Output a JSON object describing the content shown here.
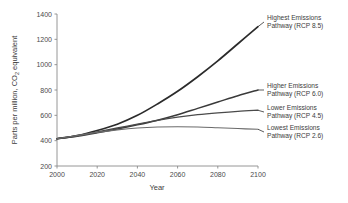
{
  "chart_data": {
    "type": "line",
    "title": "",
    "xlabel": "Year",
    "ylabel": "Parts per million, CO2 equivalent",
    "ylabel_main": "Parts per million, CO",
    "ylabel_sub": "2",
    "ylabel_tail": " equivalent",
    "xlim": [
      2000,
      2100
    ],
    "ylim": [
      200,
      1400
    ],
    "grid": false,
    "legend_position": "right-inline-annotations",
    "xticks": [
      2000,
      2020,
      2040,
      2060,
      2080,
      2100
    ],
    "xtick_labels": [
      "2000",
      "2020",
      "2040",
      "2060",
      "2080",
      "2100"
    ],
    "yticks": [
      200,
      400,
      600,
      800,
      1000,
      1200,
      1400
    ],
    "ytick_labels": [
      "200",
      "400",
      "600",
      "800",
      "1000",
      "1200",
      "1400"
    ],
    "x": [
      2000,
      2010,
      2020,
      2030,
      2040,
      2050,
      2060,
      2070,
      2080,
      2090,
      2100
    ],
    "series": [
      {
        "name": "Highest Emissions Pathway (RCP 8.5)",
        "label_line1": "Highest Emissions",
        "label_line2": "Pathway (RCP 8.5)",
        "color": "#2b2b2b",
        "width": 1.7,
        "values": [
          415,
          440,
          480,
          530,
          600,
          690,
          790,
          905,
          1030,
          1165,
          1300
        ]
      },
      {
        "name": "Higher Emissions Pathway (RCP 6.0)",
        "label_line1": "Higher Emissions",
        "label_line2": "Pathway (RCP 6.0)",
        "color": "#3a3a3a",
        "width": 1.5,
        "values": [
          415,
          435,
          462,
          492,
          525,
          562,
          605,
          655,
          705,
          755,
          800
        ]
      },
      {
        "name": "Lower Emissions Pathway (RCP 4.5)",
        "label_line1": "Lower Emissions",
        "label_line2": "Pathway (RCP 4.5)",
        "color": "#4a4a4a",
        "width": 1.3,
        "values": [
          415,
          440,
          470,
          500,
          530,
          560,
          585,
          605,
          620,
          632,
          640
        ]
      },
      {
        "name": "Lowest Emissions Pathway (RCP 2.6)",
        "label_line1": "Lowest Emissions",
        "label_line2": "Pathway (RCP 2.6)",
        "color": "#6a6a6a",
        "width": 1.2,
        "values": [
          415,
          440,
          465,
          485,
          500,
          508,
          510,
          508,
          502,
          496,
          490
        ]
      }
    ],
    "annotations": [
      {
        "series": "Highest Emissions Pathway (RCP 8.5)",
        "line1": "Highest Emissions",
        "line2": "Pathway (RCP 8.5)"
      },
      {
        "series": "Higher Emissions Pathway (RCP 6.0)",
        "line1": "Higher Emissions",
        "line2": "Pathway (RCP 6.0)"
      },
      {
        "series": "Lower Emissions Pathway (RCP 4.5)",
        "line1": "Lower Emissions",
        "line2": "Pathway (RCP 4.5)"
      },
      {
        "series": "Lowest Emissions Pathway (RCP 2.6)",
        "line1": "Lowest Emissions",
        "line2": "Pathway (RCP 2.6)"
      }
    ]
  }
}
